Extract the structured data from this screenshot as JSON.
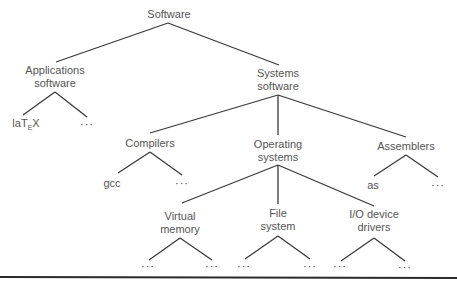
{
  "diagram": {
    "type": "tree",
    "root": {
      "label": "Software",
      "children": [
        {
          "label": "Applications software",
          "children": [
            {
              "label": "laTEX"
            },
            {
              "label": "..."
            }
          ]
        },
        {
          "label": "Systems software",
          "children": [
            {
              "label": "Compilers",
              "children": [
                {
                  "label": "gcc"
                },
                {
                  "label": "..."
                }
              ]
            },
            {
              "label": "Operating systems",
              "children": [
                {
                  "label": "Virtual memory",
                  "children": [
                    {
                      "label": "..."
                    },
                    {
                      "label": "..."
                    }
                  ]
                },
                {
                  "label": "File system",
                  "children": [
                    {
                      "label": "..."
                    },
                    {
                      "label": "..."
                    }
                  ]
                },
                {
                  "label": "I/O device drivers",
                  "children": [
                    {
                      "label": "..."
                    },
                    {
                      "label": "..."
                    }
                  ]
                }
              ]
            },
            {
              "label": "Assemblers",
              "children": [
                {
                  "label": "as"
                },
                {
                  "label": "..."
                }
              ]
            }
          ]
        }
      ]
    }
  },
  "labels": {
    "software": "Software",
    "applications_l1": "Applications",
    "applications_l2": "software",
    "systems_l1": "Systems",
    "systems_l2": "software",
    "latex_pre": "laT",
    "latex_sub": "E",
    "latex_post": "X",
    "ellipsis": "···",
    "compilers": "Compilers",
    "gcc": "gcc",
    "operating_l1": "Operating",
    "operating_l2": "systems",
    "assemblers": "Assemblers",
    "as": "as",
    "virtual_l1": "Virtual",
    "virtual_l2": "memory",
    "file_l1": "File",
    "file_l2": "system",
    "io_l1": "I/O device",
    "io_l2": "drivers"
  },
  "colors": {
    "line": "#3a3a3a",
    "text": "#555555",
    "background": "#ffffff"
  }
}
